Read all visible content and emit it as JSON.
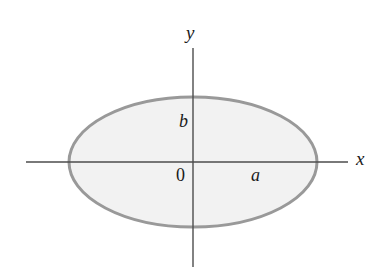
{
  "figure": {
    "background_color": "#ffffff"
  },
  "axes": {
    "x_axis": {
      "label": "x",
      "color": "#4d4d4d",
      "start_x": 26,
      "end_x": 348,
      "y": 162
    },
    "y_axis": {
      "label": "y",
      "color": "#4d4d4d",
      "x": 193,
      "start_y": 48,
      "end_y": 267
    }
  },
  "shape": {
    "type": "ellipse",
    "center": {
      "x": 193,
      "y": 162
    },
    "semi_axis_a": 124,
    "semi_axis_b": 65,
    "fill_color": "#f2f2f2",
    "stroke_color": "#999999",
    "stroke_width": 3
  },
  "labels": {
    "origin": "0",
    "semi_major": "a",
    "semi_minor": "b",
    "x_axis": "x",
    "y_axis": "y"
  },
  "chart_data": {
    "type": "scatter",
    "xlabel": "x",
    "ylabel": "y",
    "annotations": [
      "0",
      "a",
      "b"
    ],
    "curve": "x^2/a^2 + y^2/b^2 = 1",
    "semi_axis_a_px": 124,
    "semi_axis_b_px": 65,
    "center_px": [
      193,
      162
    ],
    "grid": false,
    "legend": "none"
  }
}
